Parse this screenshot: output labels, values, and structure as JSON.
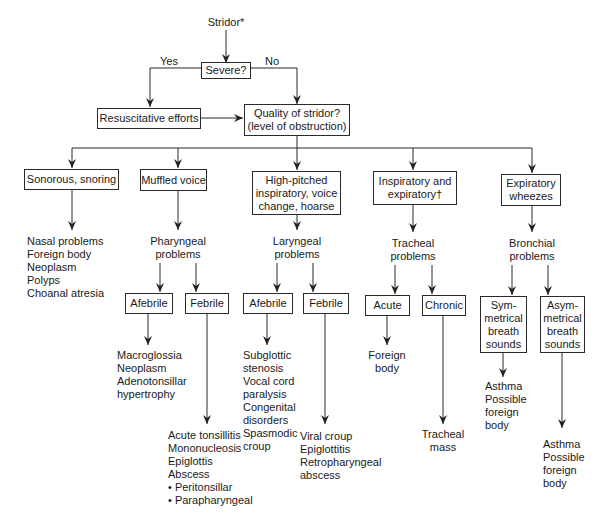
{
  "diagram": {
    "type": "flowchart",
    "root": "Stridor*",
    "decision": {
      "question": "Severe?",
      "yes_label": "Yes",
      "no_label": "No",
      "yes_action": "Resuscitative efforts",
      "next": "Quality of stridor?\n(level of obstruction)"
    },
    "categories": [
      {
        "label": "Sonorous, snoring",
        "outcome": "Nasal problems\nForeign body\nNeoplasm\nPolyps\nChoanal atresia"
      },
      {
        "label": "Muffled voice",
        "problem": "Pharyngeal\nproblems",
        "branches": [
          {
            "label": "Afebrile",
            "outcome": "Macroglossia\nNeoplasm\nAdenotonsillar\n  hypertrophy"
          },
          {
            "label": "Febrile",
            "outcome": "Acute tonsillitis\nMononucleosis\nEpiglottis\nAbscess\n• Peritonsillar\n• Parapharyngeal"
          }
        ]
      },
      {
        "label": "High-pitched\ninspiratory, voice\nchange, hoarse",
        "problem": "Laryngeal\nproblems",
        "branches": [
          {
            "label": "Afebrile",
            "outcome": "Subglottic\n  stenosis\nVocal cord\n  paralysis\nCongenital\n  disorders\nSpasmodic\n  croup"
          },
          {
            "label": "Febrile",
            "outcome": "Viral croup\nEpiglottitis\nRetropharyngeal\n  abscess"
          }
        ]
      },
      {
        "label": "Inspiratory and\nexpiratory†",
        "problem": "Tracheal\nproblems",
        "branches": [
          {
            "label": "Acute",
            "outcome": "Foreign\nbody"
          },
          {
            "label": "Chronic",
            "outcome": "Tracheal\nmass"
          }
        ]
      },
      {
        "label": "Expiratory\nwheezes",
        "problem": "Bronchial\nproblems",
        "branches": [
          {
            "label": "Sym-\nmetrical\nbreath\nsounds",
            "outcome": "Asthma\nPossible\n  foreign\n  body"
          },
          {
            "label": "Asym-\nmetrical\nbreath\nsounds",
            "outcome": "Asthma\nPossible\n  foreign\n  body"
          }
        ]
      }
    ],
    "stroke_color": "#2a2a2a",
    "text_color": "#1a1a1a",
    "background": "#ffffff"
  }
}
